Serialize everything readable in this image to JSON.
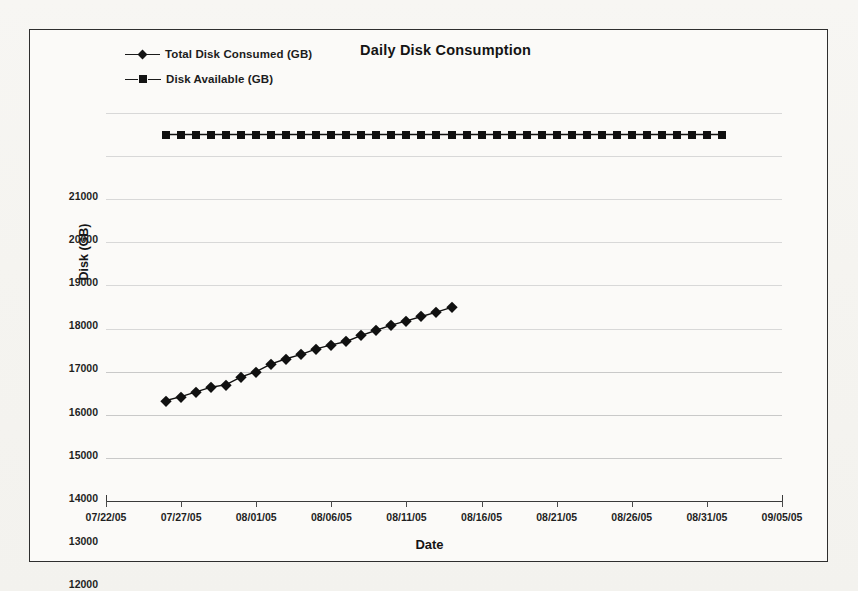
{
  "chart_data": {
    "type": "line",
    "title": "Daily Disk Consumption",
    "xlabel": "Date",
    "ylabel": "Disk (GB)",
    "grid": true,
    "legend_position": "top-left",
    "ylim": [
      12000,
      21000
    ],
    "ytick_labels": [
      "12000",
      "13000",
      "14000",
      "15000",
      "16000",
      "17000",
      "18000",
      "19000",
      "20000",
      "21000"
    ],
    "ytick_values": [
      12000,
      13000,
      14000,
      15000,
      16000,
      17000,
      18000,
      19000,
      20000,
      21000
    ],
    "xtick_labels": [
      "07/22/05",
      "07/27/05",
      "08/01/05",
      "08/06/05",
      "08/11/05",
      "08/16/05",
      "08/21/05",
      "08/26/05",
      "08/31/05",
      "09/05/05"
    ],
    "xlim": [
      "07/22/05",
      "09/05/05"
    ],
    "series": [
      {
        "name": "Total Disk Consumed (GB)",
        "marker": "diamond",
        "color": "#101010",
        "x": [
          "07/26/05",
          "07/27/05",
          "07/28/05",
          "07/29/05",
          "07/30/05",
          "07/31/05",
          "08/01/05",
          "08/02/05",
          "08/03/05",
          "08/04/05",
          "08/05/05",
          "08/06/05",
          "08/07/05",
          "08/08/05",
          "08/09/05",
          "08/10/05",
          "08/11/05",
          "08/12/05",
          "08/13/05",
          "08/14/05"
        ],
        "values": [
          14330,
          14420,
          14530,
          14640,
          14700,
          14880,
          15000,
          15180,
          15300,
          15400,
          15530,
          15620,
          15700,
          15840,
          15960,
          16080,
          16180,
          16280,
          16380,
          16490
        ]
      },
      {
        "name": "Disk Available (GB)",
        "marker": "square",
        "color": "#101010",
        "x": [
          "07/26/05",
          "07/27/05",
          "07/28/05",
          "07/29/05",
          "07/30/05",
          "07/31/05",
          "08/01/05",
          "08/02/05",
          "08/03/05",
          "08/04/05",
          "08/05/05",
          "08/06/05",
          "08/07/05",
          "08/08/05",
          "08/09/05",
          "08/10/05",
          "08/11/05",
          "08/12/05",
          "08/13/05",
          "08/14/05",
          "08/15/05",
          "08/16/05",
          "08/17/05",
          "08/18/05",
          "08/19/05",
          "08/20/05",
          "08/21/05",
          "08/22/05",
          "08/23/05",
          "08/24/05",
          "08/25/05",
          "08/26/05",
          "08/27/05",
          "08/28/05",
          "08/29/05",
          "08/30/05",
          "08/31/05",
          "09/01/05"
        ],
        "values": [
          20500,
          20500,
          20500,
          20500,
          20500,
          20500,
          20500,
          20500,
          20500,
          20500,
          20500,
          20500,
          20500,
          20500,
          20500,
          20500,
          20500,
          20500,
          20500,
          20500,
          20500,
          20500,
          20500,
          20500,
          20500,
          20500,
          20500,
          20500,
          20500,
          20500,
          20500,
          20500,
          20500,
          20500,
          20500,
          20500,
          20500,
          20500
        ]
      }
    ]
  },
  "legend": {
    "items": [
      {
        "label": "Total Disk Consumed (GB)",
        "marker": "diamond"
      },
      {
        "label": "Disk Available (GB)",
        "marker": "square"
      }
    ]
  },
  "axes": {
    "y_title": "Disk (GB)",
    "x_title": "Date"
  },
  "title": "Daily Disk Consumption"
}
